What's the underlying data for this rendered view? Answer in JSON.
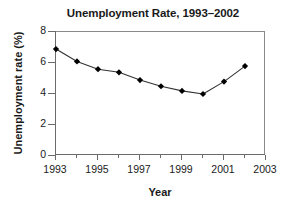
{
  "chart_data": {
    "type": "line",
    "title": "Unemployment Rate, 1993–2002",
    "xlabel": "Year",
    "ylabel": "Unemployment rate (%)",
    "x": [
      1993,
      1994,
      1995,
      1996,
      1997,
      1998,
      1999,
      2000,
      2001,
      2002
    ],
    "values": [
      6.9,
      6.1,
      5.6,
      5.4,
      4.9,
      4.5,
      4.2,
      4.0,
      4.8,
      5.8
    ],
    "series": [
      {
        "name": "Unemployment rate",
        "values": [
          6.9,
          6.1,
          5.6,
          5.4,
          4.9,
          4.5,
          4.2,
          4.0,
          4.8,
          5.8
        ]
      }
    ],
    "xlim": [
      1993,
      2003
    ],
    "ylim": [
      0,
      8
    ],
    "xticks": [
      1993,
      1995,
      1997,
      1999,
      2001,
      2003
    ],
    "xtick_labels": [
      "1993",
      "1995",
      "1997",
      "1999",
      "2001",
      "2003"
    ],
    "xticks_minor": [
      1994,
      1996,
      1998,
      2000,
      2002
    ],
    "yticks": [
      0,
      2,
      4,
      6,
      8
    ],
    "ytick_labels": [
      "0",
      "2",
      "4",
      "6",
      "8"
    ],
    "grid": false,
    "legend": false,
    "marker": "diamond",
    "line_color": "#333333",
    "marker_color": "#000000",
    "axis_color": "#6b6b6b",
    "background": "#ffffff"
  }
}
